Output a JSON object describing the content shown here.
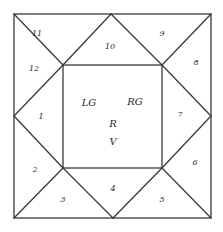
{
  "diagram": {
    "type": "square-dissection",
    "colors": {
      "background": "#ffffff",
      "stroke": "#3a3a3a",
      "text": "#2a2a2a"
    },
    "outer_square": {
      "x1": 14,
      "y1": 14,
      "x2": 211,
      "y2": 218
    },
    "inner_square": {
      "x1": 63,
      "y1": 65,
      "x2": 162,
      "y2": 168
    },
    "midpoints": {
      "top": [
        111,
        14
      ],
      "right": [
        211,
        116
      ],
      "bottom": [
        113,
        218
      ],
      "left": [
        14,
        116
      ]
    },
    "triangle_labels": [
      {
        "id": "t1",
        "text": "1",
        "x": 41,
        "y": 117
      },
      {
        "id": "t2",
        "text": "2",
        "x": 35,
        "y": 170
      },
      {
        "id": "t3",
        "text": "3",
        "x": 63,
        "y": 200
      },
      {
        "id": "t4",
        "text": "4",
        "x": 113,
        "y": 189
      },
      {
        "id": "t5",
        "text": "5",
        "x": 162,
        "y": 200
      },
      {
        "id": "t6",
        "text": "6",
        "x": 195,
        "y": 163
      },
      {
        "id": "t7",
        "text": "7",
        "x": 180,
        "y": 115
      },
      {
        "id": "t8",
        "text": "8",
        "x": 196,
        "y": 63
      },
      {
        "id": "t9",
        "text": "9",
        "x": 162,
        "y": 34
      },
      {
        "id": "t10",
        "text": "10",
        "x": 110,
        "y": 47
      },
      {
        "id": "t11",
        "text": "11",
        "x": 37,
        "y": 34
      },
      {
        "id": "t12",
        "text": "12",
        "x": 34,
        "y": 69
      }
    ],
    "center_labels": [
      {
        "id": "lg",
        "text": "LG",
        "x": 89,
        "y": 103
      },
      {
        "id": "rg",
        "text": "RG",
        "x": 135,
        "y": 102
      },
      {
        "id": "r",
        "text": "R",
        "x": 113,
        "y": 124
      },
      {
        "id": "v",
        "text": "V",
        "x": 113,
        "y": 142
      }
    ]
  }
}
